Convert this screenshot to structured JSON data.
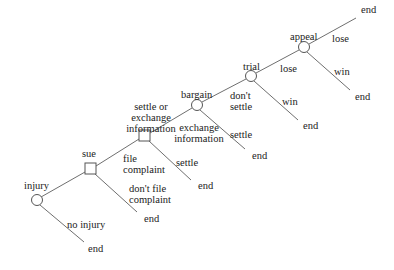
{
  "diagram": {
    "type": "decision-tree",
    "nodes": [
      {
        "id": "injury",
        "label": "injury",
        "shape": "circle"
      },
      {
        "id": "sue",
        "label": "sue",
        "shape": "square"
      },
      {
        "id": "settle_or_exchange",
        "label": "settle or\nexchange\ninformation",
        "shape": "square"
      },
      {
        "id": "bargain",
        "label": "bargain",
        "shape": "circle"
      },
      {
        "id": "trial",
        "label": "trial",
        "shape": "circle"
      },
      {
        "id": "appeal",
        "label": "appeal",
        "shape": "circle"
      }
    ],
    "edges": [
      {
        "from": "injury",
        "to": "sue",
        "label": ""
      },
      {
        "from": "injury",
        "to": "end",
        "label": "no injury"
      },
      {
        "from": "sue",
        "to": "settle_or_exchange",
        "label": "file\ncomplaint"
      },
      {
        "from": "sue",
        "to": "end",
        "label": "don't file\ncomplaint"
      },
      {
        "from": "settle_or_exchange",
        "to": "bargain",
        "label": "exchange\ninformation"
      },
      {
        "from": "settle_or_exchange",
        "to": "end",
        "label": "settle"
      },
      {
        "from": "bargain",
        "to": "trial",
        "label": "don't\nsettle"
      },
      {
        "from": "bargain",
        "to": "end",
        "label": "settle"
      },
      {
        "from": "trial",
        "to": "appeal",
        "label": "lose"
      },
      {
        "from": "trial",
        "to": "end",
        "label": "win"
      },
      {
        "from": "appeal",
        "to": "end",
        "label": "lose"
      },
      {
        "from": "appeal",
        "to": "end",
        "label": "win"
      }
    ],
    "end_label": "end",
    "labels": {
      "injury": "injury",
      "no_injury": "no injury",
      "end_no_injury": "end",
      "sue": "sue",
      "file_complaint": "file\ncomplaint",
      "dont_file_complaint": "don't file\ncomplaint",
      "end_dont_file": "end",
      "settle_or_exchange": "settle or\nexchange\ninformation",
      "exchange_information": "exchange\ninformation",
      "settle_1": "settle",
      "end_settle_1": "end",
      "bargain": "bargain",
      "dont_settle": "don't\nsettle",
      "settle_2": "settle",
      "end_settle_2": "end",
      "trial": "trial",
      "trial_lose": "lose",
      "trial_win": "win",
      "end_trial_win": "end",
      "appeal": "appeal",
      "appeal_lose": "lose",
      "end_appeal_lose": "end",
      "appeal_win": "win",
      "end_appeal_win": "end"
    },
    "colors": {
      "line": "#6f6f6f",
      "text": "#222222",
      "background": "#ffffff"
    }
  }
}
